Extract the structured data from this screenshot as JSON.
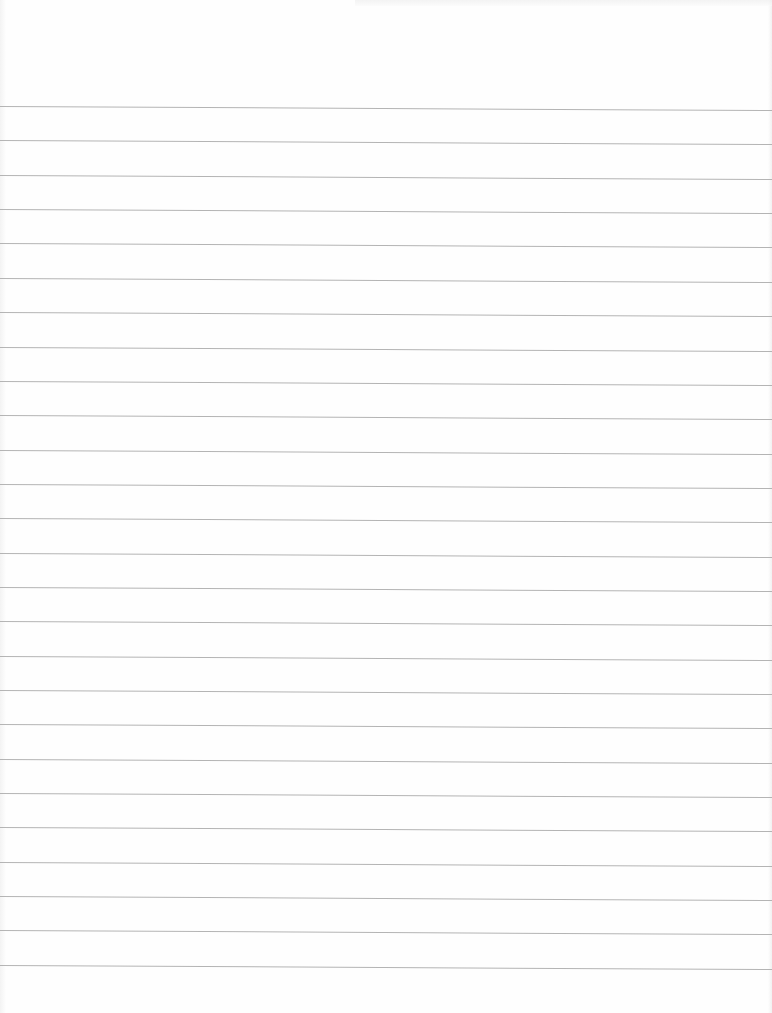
{
  "page": {
    "type": "lined-paper",
    "background_color": "#fefefe",
    "rule_color": "#b4b4b4",
    "rule_count": 26,
    "first_rule_y": 106,
    "rule_spacing": 34.35
  }
}
